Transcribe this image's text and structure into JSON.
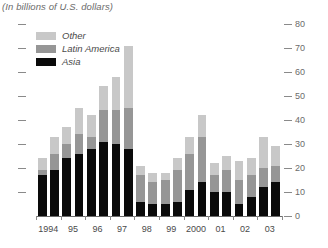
{
  "header": {
    "title_clipped": "Emerging Market Financing",
    "subtitle": "(In billions of U.S. dollars)"
  },
  "legend": {
    "position": "top-left-inside",
    "items": [
      {
        "label": "Other",
        "color": "#c8c8c8",
        "key": "other"
      },
      {
        "label": "Latin America",
        "color": "#969696",
        "key": "latin_america"
      },
      {
        "label": "Asia",
        "color": "#0a0a0a",
        "key": "asia"
      }
    ]
  },
  "axes": {
    "y_right_labels": [
      "80",
      "70",
      "60",
      "50",
      "40",
      "30",
      "20",
      "10",
      "0"
    ],
    "y_right_values": [
      80,
      70,
      60,
      50,
      40,
      30,
      20,
      10,
      0
    ],
    "y_left_labels": [
      "",
      "",
      "",
      "",
      "",
      "",
      "",
      "",
      ""
    ],
    "x_labels": [
      "1994",
      "95",
      "96",
      "97",
      "98",
      "99",
      "2000",
      "01",
      "02",
      "03"
    ]
  },
  "chart_data": {
    "type": "bar",
    "title": "Emerging Market Financing",
    "subtitle": "(In billions of U.S. dollars)",
    "xlabel": "",
    "ylabel": "",
    "ylim": [
      0,
      80
    ],
    "ytick_step": 10,
    "grid": false,
    "stacked": true,
    "legend_position": "top-left",
    "categories": [
      "1994 H1",
      "1994 H2",
      "95 H1",
      "95 H2",
      "96 H1",
      "96 H2",
      "97 H1",
      "97 H2",
      "98 H1",
      "98 H2",
      "99 H1",
      "99 H2",
      "2000 H1",
      "2000 H2",
      "01 H1",
      "01 H2",
      "02 H1",
      "02 H2",
      "03 H1",
      "03 H2"
    ],
    "x_axis_year_labels": [
      "1994",
      "95",
      "96",
      "97",
      "98",
      "99",
      "2000",
      "01",
      "02",
      "03"
    ],
    "series": [
      {
        "name": "Asia",
        "color": "#0a0a0a",
        "values": [
          17,
          19,
          24,
          26,
          28,
          31,
          30,
          28,
          6,
          5,
          5,
          6,
          11,
          14,
          10,
          10,
          5,
          8,
          12,
          14
        ]
      },
      {
        "name": "Latin America",
        "color": "#969696",
        "values": [
          2,
          7,
          6,
          8,
          5,
          13,
          14,
          17,
          11,
          9,
          10,
          13,
          15,
          19,
          7,
          9,
          10,
          9,
          8,
          7
        ]
      },
      {
        "name": "Other",
        "color": "#c8c8c8",
        "values": [
          5,
          7,
          7,
          11,
          9,
          10,
          14,
          26,
          4,
          4,
          3,
          5,
          7,
          9,
          5,
          6,
          8,
          7,
          13,
          8
        ]
      }
    ],
    "totals": [
      24,
      33,
      37,
      45,
      42,
      54,
      58,
      71,
      21,
      18,
      18,
      24,
      33,
      42,
      22,
      25,
      23,
      24,
      33,
      29
    ]
  }
}
